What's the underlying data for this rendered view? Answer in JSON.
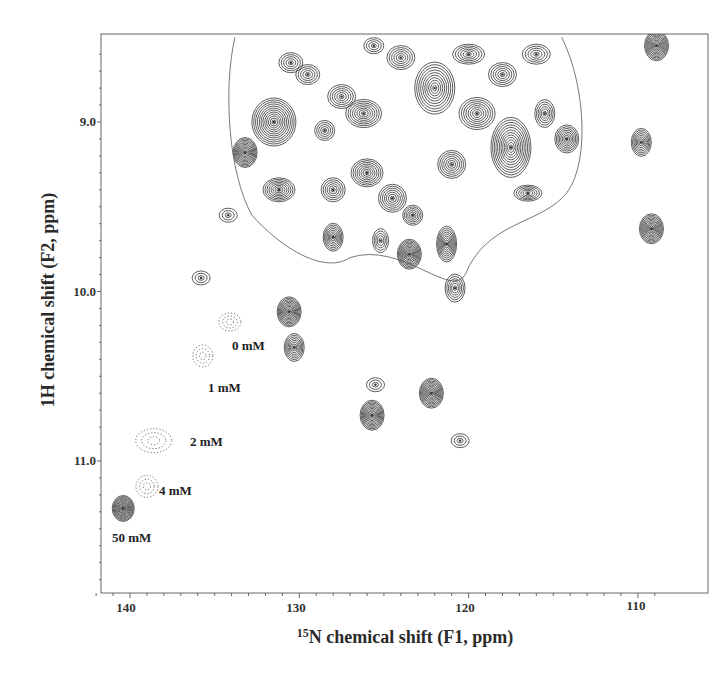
{
  "chart_data": {
    "type": "contour",
    "title": "",
    "xlabel": "15N chemical shift (F1, ppm)",
    "xlabel_superscript": "15",
    "xlabel_rest": "N chemical shift (F1, ppm)",
    "ylabel": "1H chemical shift (F2, ppm)",
    "xlim": [
      142.2,
      108.1
    ],
    "ylim": [
      8.5,
      11.8
    ],
    "x_ticks": [
      140,
      130,
      120,
      110
    ],
    "x_tick_labels": [
      "140",
      "130",
      "120",
      "110"
    ],
    "y_ticks": [
      9.0,
      10.0,
      11.0
    ],
    "y_tick_labels": [
      "9.0",
      "10.0",
      "11.0"
    ],
    "x_axis_reversed": true,
    "y_axis_reversed": true,
    "grid": false,
    "legend": null,
    "titration_series": {
      "description": "Peak shifting with increasing concentration (dotted contours for 0-4 mM, solid for 50 mM)",
      "points": [
        {
          "label": "0 mM",
          "n_ppm": 134.1,
          "h_ppm": 10.18,
          "style": "dotted"
        },
        {
          "label": "1 mM",
          "n_ppm": 135.7,
          "h_ppm": 10.38,
          "style": "dotted"
        },
        {
          "label": "2 mM",
          "n_ppm": 138.6,
          "h_ppm": 10.88,
          "style": "dotted"
        },
        {
          "label": "4 mM",
          "n_ppm": 139.0,
          "h_ppm": 11.15,
          "style": "dotted"
        },
        {
          "label": "50 mM",
          "n_ppm": 140.4,
          "h_ppm": 11.28,
          "style": "solid"
        }
      ]
    },
    "isolated_peaks": [
      {
        "n_ppm": 133.2,
        "h_ppm": 9.18,
        "intensity": "strong"
      },
      {
        "n_ppm": 135.8,
        "h_ppm": 9.92,
        "intensity": "weak"
      },
      {
        "n_ppm": 130.6,
        "h_ppm": 10.12,
        "intensity": "strong"
      },
      {
        "n_ppm": 130.3,
        "h_ppm": 10.33,
        "intensity": "medium"
      },
      {
        "n_ppm": 125.5,
        "h_ppm": 10.55,
        "intensity": "weak"
      },
      {
        "n_ppm": 125.7,
        "h_ppm": 10.73,
        "intensity": "strong"
      },
      {
        "n_ppm": 122.2,
        "h_ppm": 10.6,
        "intensity": "strong"
      },
      {
        "n_ppm": 120.5,
        "h_ppm": 10.88,
        "intensity": "weak"
      },
      {
        "n_ppm": 123.5,
        "h_ppm": 9.78,
        "intensity": "strong"
      },
      {
        "n_ppm": 109.2,
        "h_ppm": 9.63,
        "intensity": "strong"
      },
      {
        "n_ppm": 109.8,
        "h_ppm": 9.12,
        "intensity": "medium"
      },
      {
        "n_ppm": 108.9,
        "h_ppm": 8.55,
        "intensity": "strong"
      },
      {
        "n_ppm": 134.2,
        "h_ppm": 9.55,
        "intensity": "weak"
      },
      {
        "n_ppm": 122.5,
        "h_ppm": 11.83,
        "intensity": "weak"
      }
    ],
    "crowded_region": {
      "n_ppm_range": [
        134,
        113
      ],
      "h_ppm_range": [
        8.5,
        9.9
      ]
    }
  },
  "labels": {
    "x_ticks": [
      "140",
      "130",
      "120",
      "110"
    ],
    "y_ticks": [
      "9.0",
      "10.0",
      "11.0"
    ],
    "x_title_sup": "15",
    "x_title_rest": "N chemical shift (F1, ppm)",
    "y_title": "1H chemical shift (F2, ppm)",
    "concentrations": [
      "0 mM",
      "1 mM",
      "2 mM",
      "4 mM",
      "50 mM"
    ]
  }
}
